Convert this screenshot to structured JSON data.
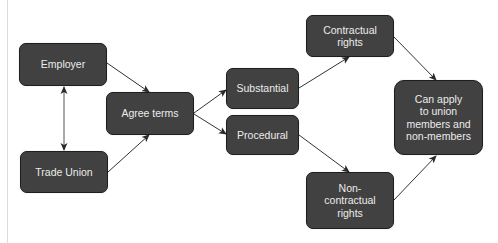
{
  "diagram": {
    "nodes": {
      "employer": {
        "label": "Employer"
      },
      "trade_union": {
        "label": "Trade Union"
      },
      "agree_terms": {
        "label": "Agree terms"
      },
      "substantial": {
        "label": "Substantial"
      },
      "procedural": {
        "label": "Procedural"
      },
      "contractual_rights": {
        "label": "Contractual\nrights"
      },
      "non_contractual_rights": {
        "label": "Non-\ncontractual\nrights"
      },
      "can_apply": {
        "label": "Can apply\nto union\nmembers and\nnon-members"
      }
    },
    "edges": [
      {
        "from": "employer",
        "to": "trade_union",
        "direction": "both"
      },
      {
        "from": "employer",
        "to": "agree_terms",
        "direction": "forward"
      },
      {
        "from": "trade_union",
        "to": "agree_terms",
        "direction": "forward"
      },
      {
        "from": "agree_terms",
        "to": "substantial",
        "direction": "forward"
      },
      {
        "from": "agree_terms",
        "to": "procedural",
        "direction": "forward"
      },
      {
        "from": "substantial",
        "to": "contractual_rights",
        "direction": "forward"
      },
      {
        "from": "procedural",
        "to": "non_contractual_rights",
        "direction": "forward"
      },
      {
        "from": "contractual_rights",
        "to": "can_apply",
        "direction": "forward"
      },
      {
        "from": "non_contractual_rights",
        "to": "can_apply",
        "direction": "forward"
      }
    ],
    "colors": {
      "node_fill": "#414141",
      "node_border": "#1e1e1e",
      "node_text": "#ececec",
      "arrow": "#333333",
      "background": "#ffffff",
      "margin_rule": "#dcdcdc"
    }
  }
}
